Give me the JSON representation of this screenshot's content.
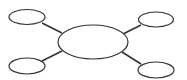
{
  "diagram": {
    "type": "mind-map",
    "colors": {
      "stroke": "#333333",
      "fill": "#ffffff",
      "background": "#ffffff"
    },
    "center": {
      "id": "center",
      "label": "",
      "cx": 93,
      "cy": 42,
      "rx": 35,
      "ry": 17
    },
    "satellites": [
      {
        "id": "top-left",
        "label": "",
        "cx": 27,
        "cy": 17,
        "rx": 18,
        "ry": 7.5
      },
      {
        "id": "top-right",
        "label": "",
        "cx": 156,
        "cy": 19.5,
        "rx": 17.5,
        "ry": 7.5
      },
      {
        "id": "bottom-left",
        "label": "",
        "cx": 27,
        "cy": 66,
        "rx": 18,
        "ry": 8
      },
      {
        "id": "bottom-right",
        "label": "",
        "cx": 156,
        "cy": 70,
        "rx": 18,
        "ry": 8
      }
    ],
    "edges": [
      {
        "from": "top-left",
        "to": "center",
        "x1": 42,
        "y1": 23,
        "x2": 62,
        "y2": 33
      },
      {
        "from": "top-right",
        "to": "center",
        "x1": 141,
        "y1": 25,
        "x2": 123,
        "y2": 34
      },
      {
        "from": "bottom-left",
        "to": "center",
        "x1": 42,
        "y1": 61,
        "x2": 62,
        "y2": 51
      },
      {
        "from": "bottom-right",
        "to": "center",
        "x1": 141,
        "y1": 64,
        "x2": 122,
        "y2": 52
      }
    ]
  }
}
